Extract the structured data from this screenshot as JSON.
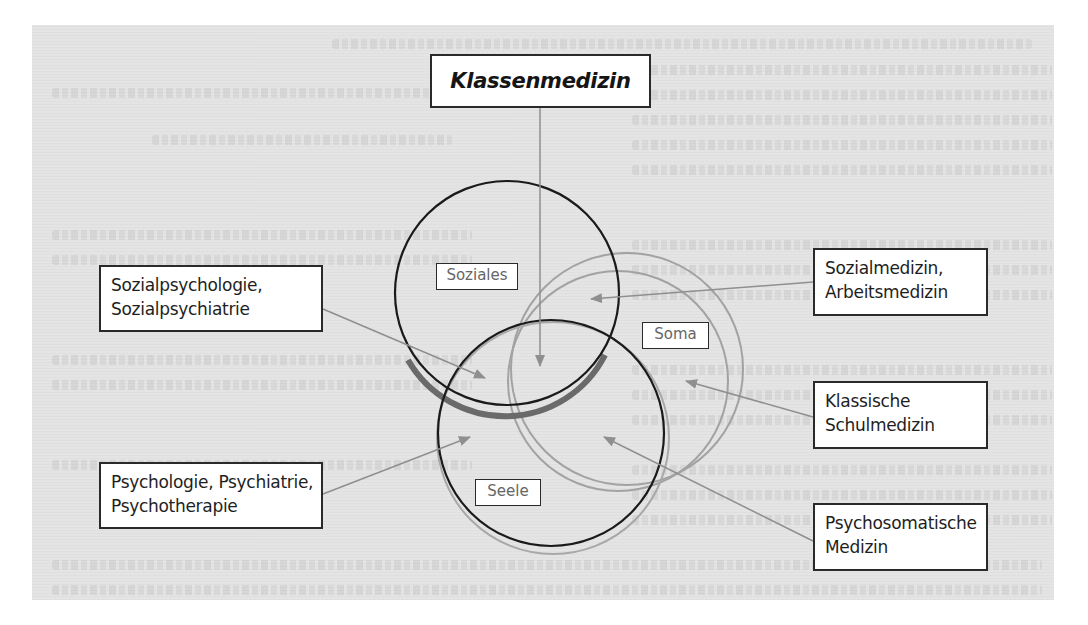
{
  "diagram": {
    "title": "Klassenmedizin",
    "circles": [
      {
        "id": "soziales",
        "label": "Soziales",
        "cx": 507,
        "cy": 293,
        "r": 112,
        "stroke": "#1a1a1a"
      },
      {
        "id": "seele",
        "label": "Seele",
        "cx": 551,
        "cy": 433,
        "r": 113,
        "stroke": "#1a1a1a"
      },
      {
        "id": "soma",
        "label": "Soma",
        "cx": 622,
        "cy": 377,
        "r": 114,
        "stroke": "#9a9a9a"
      }
    ],
    "left_boxes": [
      {
        "id": "sozialpsychologie",
        "lines": [
          "Sozialpsychologie,",
          "Sozialpsychiatrie"
        ]
      },
      {
        "id": "psychologie",
        "lines": [
          "Psychologie, Psychiatrie,",
          "Psychotherapie"
        ]
      }
    ],
    "right_boxes": [
      {
        "id": "sozialmedizin",
        "lines": [
          "Sozialmedizin,",
          "Arbeitsmedizin"
        ]
      },
      {
        "id": "klassische",
        "lines": [
          "Klassische",
          "Schulmedizin"
        ]
      },
      {
        "id": "psychosomatische",
        "lines": [
          "Psychosomatische",
          "Medizin"
        ]
      }
    ],
    "colors": {
      "background_panel": "#e4e4e4",
      "arrow": "#8f8f8f",
      "circle_dark": "#1a1a1a",
      "circle_light": "#9a9a9a",
      "shadow": "#6a6a6a"
    }
  }
}
